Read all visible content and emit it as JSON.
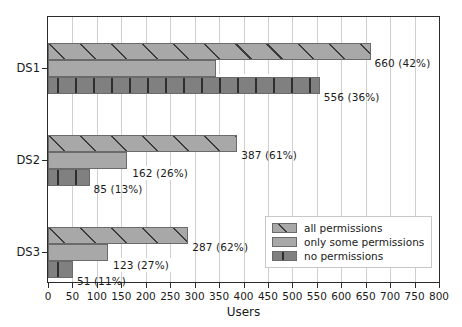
{
  "chart_data": {
    "type": "bar",
    "orientation": "horizontal",
    "title": "",
    "xlabel": "Users",
    "ylabel": "",
    "xlim": [
      0,
      800
    ],
    "ylim": [
      0,
      3
    ],
    "grid": "vertical",
    "legend_position": "lower right",
    "categories": [
      "DS1",
      "DS2",
      "DS3"
    ],
    "xticks": [
      0,
      50,
      100,
      150,
      200,
      250,
      300,
      350,
      400,
      450,
      500,
      550,
      600,
      650,
      700,
      750,
      800
    ],
    "xticklabels": [
      "0",
      "50",
      "100",
      "150",
      "200",
      "250",
      "300",
      "350",
      "400",
      "450",
      "500",
      "550",
      "600",
      "650",
      "700",
      "750",
      "800"
    ],
    "series": [
      {
        "name": "all permissions",
        "style": "hatch-diagonal",
        "color": "#a8a8a8",
        "values": [
          660,
          387,
          287
        ],
        "percents": [
          "42%",
          "26%",
          "27%"
        ],
        "labels": [
          "660 (42%)",
          "387 (61%)",
          "287 (62%)"
        ]
      },
      {
        "name": "only some permissions",
        "style": "solid",
        "color": "#a8a8a8",
        "values": [
          344,
          162,
          123
        ],
        "percents": [
          "22%",
          "26%",
          "27%"
        ],
        "labels": [
          "344 (22%)",
          "162 (26%)",
          "123 (27%)"
        ]
      },
      {
        "name": "no permissions",
        "style": "hatch-vertical",
        "color": "#808080",
        "values": [
          556,
          85,
          51
        ],
        "percents": [
          "36%",
          "13%",
          "11%"
        ],
        "labels": [
          "556 (36%)",
          "85 (13%)",
          "51 (11%)"
        ]
      }
    ],
    "bars": [
      {
        "group": "DS1",
        "series": "all permissions",
        "value": 660,
        "label": "660 (42%)",
        "boxed": false
      },
      {
        "group": "DS1",
        "series": "only some permissions",
        "value": 344,
        "label": "344 (22%)",
        "boxed": true
      },
      {
        "group": "DS1",
        "series": "no permissions",
        "value": 556,
        "label": "556 (36%)",
        "boxed": false
      },
      {
        "group": "DS2",
        "series": "all permissions",
        "value": 387,
        "label": "387 (61%)",
        "boxed": false
      },
      {
        "group": "DS2",
        "series": "only some permissions",
        "value": 162,
        "label": "162 (26%)",
        "boxed": true
      },
      {
        "group": "DS2",
        "series": "no permissions",
        "value": 85,
        "label": "85 (13%)",
        "boxed": false
      },
      {
        "group": "DS3",
        "series": "all permissions",
        "value": 287,
        "label": "287 (62%)",
        "boxed": false
      },
      {
        "group": "DS3",
        "series": "only some permissions",
        "value": 123,
        "label": "123 (27%)",
        "boxed": true
      },
      {
        "group": "DS3",
        "series": "no permissions",
        "value": 51,
        "label": "51 (11%)",
        "boxed": false
      }
    ]
  },
  "legend": {
    "entries": [
      {
        "label": "all permissions",
        "style": "all"
      },
      {
        "label": "only some permissions",
        "style": "some"
      },
      {
        "label": "no permissions",
        "style": "none"
      }
    ]
  },
  "axes": {
    "x_title": "Users"
  }
}
